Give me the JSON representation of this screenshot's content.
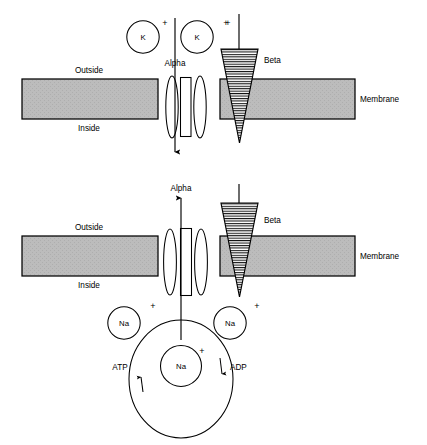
{
  "figure": {
    "title": "",
    "type": "membrane-channel-diagram",
    "panels": [
      {
        "id": "top",
        "name": "potassium-channel-panel",
        "membrane": {
          "label": "Membrane",
          "outside_label": "Outside",
          "inside_label": "Inside",
          "fill_color": "#b9b9b9",
          "stroke_color": "#000000"
        },
        "subunits": [
          {
            "name": "alpha",
            "label": "Alpha",
            "shape": "paired-ellipses-with-pore"
          },
          {
            "name": "beta",
            "label": "Beta",
            "shape": "hatched-inverted-triangle",
            "charge": "+"
          }
        ],
        "ions": [
          {
            "label": "K",
            "charge": "+",
            "position": "outside-left"
          },
          {
            "label": "K",
            "charge": "+",
            "position": "outside-right"
          }
        ],
        "flow": {
          "direction": "inward",
          "through": "alpha"
        }
      },
      {
        "id": "bottom",
        "name": "sodium-pump-panel",
        "membrane": {
          "label": "Membrane",
          "outside_label": "Outside",
          "inside_label": "Inside",
          "fill_color": "#b9b9b9",
          "stroke_color": "#000000"
        },
        "subunits": [
          {
            "name": "alpha",
            "label": "Alpha",
            "shape": "paired-ellipses-with-pore"
          },
          {
            "name": "beta",
            "label": "Beta",
            "shape": "hatched-inverted-triangle",
            "charge": "+"
          }
        ],
        "ions": [
          {
            "label": "Na",
            "charge": "+",
            "position": "inside-left"
          },
          {
            "label": "Na",
            "charge": "+",
            "position": "inside-right"
          },
          {
            "label": "Na",
            "charge": "+",
            "position": "inside-center"
          }
        ],
        "flow": {
          "direction": "outward",
          "through": "alpha"
        },
        "cycle": {
          "shape": "ellipse",
          "input": {
            "label": "ATP",
            "arrow": "up",
            "side": "left"
          },
          "output": {
            "label": "ADP",
            "arrow": "down",
            "side": "right"
          }
        }
      }
    ]
  },
  "colors": {
    "membrane_fill": "#b9b9b9",
    "stroke": "#000000",
    "background": "#ffffff",
    "beta_hatch": "#000000"
  }
}
